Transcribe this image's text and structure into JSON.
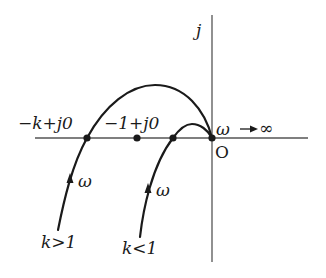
{
  "diagram": {
    "type": "nyquist-plot",
    "axes": {
      "imag_label": "j",
      "origin_label": "O"
    },
    "points": [
      {
        "id": "minus-k",
        "label": "−k+j0",
        "x": 87,
        "y": 138
      },
      {
        "id": "minus-one",
        "label": "−1+j0",
        "x": 137,
        "y": 138
      },
      {
        "id": "k-less-crossing",
        "label": "",
        "x": 173,
        "y": 138
      },
      {
        "id": "origin",
        "label": "O",
        "x": 212,
        "y": 138
      }
    ],
    "curves": [
      {
        "id": "k-greater-1",
        "label": "k>1",
        "direction_label": "ω"
      },
      {
        "id": "k-less-1",
        "label": "k<1",
        "direction_label": "ω"
      }
    ],
    "annotations": {
      "omega_infinity": "ω→∞"
    }
  },
  "labels": {
    "j": "j",
    "origin": "O",
    "minus_k": "−k+j0",
    "minus_one": "−1+j0",
    "omega_inf_omega": "ω",
    "omega_inf_inf": "∞",
    "omega_k_greater": "ω",
    "omega_k_less": "ω",
    "k_greater": "k>1",
    "k_less": "k<1"
  },
  "colors": {
    "curve": "#1a1a1a",
    "axis": "#555555",
    "background": "#ffffff"
  }
}
